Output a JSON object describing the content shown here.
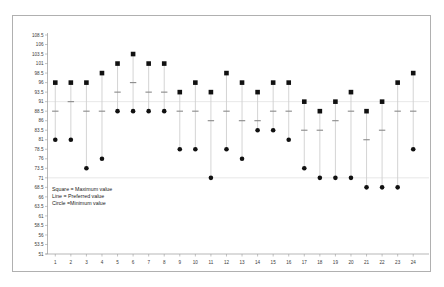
{
  "figure": {
    "background_color": "#ffffff",
    "border_color": "#b0b0b0",
    "marker_color": "#111111",
    "gridline_color": "#d8d8d8"
  },
  "legend": {
    "lines": [
      "Square = Maximum value",
      "Line = Preferred value",
      "Circle =Minimum value"
    ]
  },
  "chart_data": {
    "type": "scatter",
    "title": "",
    "xlabel": "",
    "ylabel": "",
    "grid": true,
    "legend_position": "inside-lower-left",
    "xlim": [
      0.4,
      24.6
    ],
    "ylim": [
      51,
      108.5
    ],
    "yticks": [
      51,
      53.5,
      56,
      58.5,
      61,
      63.5,
      66,
      68.5,
      71,
      73.5,
      76,
      78.5,
      81,
      83.5,
      86,
      88.5,
      91,
      93.5,
      96,
      98.5,
      101,
      103.5,
      106,
      108.5
    ],
    "ytick_labels": [
      "51",
      "53.5",
      "56",
      "58.5",
      "61",
      "63.5",
      "66",
      "68.5",
      "71",
      "73.5",
      "76",
      "78.5",
      "81",
      "83.5",
      "86",
      "88.5",
      "91",
      "93.5",
      "96",
      "98.5",
      "101",
      "103.5",
      "106",
      "108.5"
    ],
    "categories": [
      "1",
      "2",
      "3",
      "4",
      "5",
      "6",
      "7",
      "8",
      "9",
      "10",
      "11",
      "12",
      "13",
      "14",
      "15",
      "16",
      "17",
      "18",
      "19",
      "20",
      "21",
      "22",
      "23",
      "24"
    ],
    "series": [
      {
        "name": "Maximum value",
        "marker": "square",
        "values": [
          96,
          96,
          96,
          98.5,
          101,
          103.5,
          101,
          101,
          93.5,
          96,
          93.5,
          98.5,
          96,
          93.5,
          96,
          96,
          91,
          88.5,
          91,
          93.5,
          88.5,
          91,
          96,
          98.5
        ]
      },
      {
        "name": "Preferred value",
        "marker": "line",
        "values": [
          88.5,
          91,
          88.5,
          88.5,
          93.5,
          96,
          93.5,
          93.5,
          88.5,
          88.5,
          86,
          88.5,
          86,
          86,
          88.5,
          88.5,
          83.5,
          83.5,
          86,
          88.5,
          81,
          83.5,
          88.5,
          88.5
        ]
      },
      {
        "name": "Minimum value",
        "marker": "circle",
        "values": [
          81,
          81,
          73.5,
          76,
          88.5,
          88.5,
          88.5,
          88.5,
          78.5,
          78.5,
          71,
          78.5,
          76,
          83.5,
          83.5,
          81,
          73.5,
          71,
          71,
          71,
          68.5,
          68.5,
          68.5,
          78.5
        ]
      }
    ]
  }
}
